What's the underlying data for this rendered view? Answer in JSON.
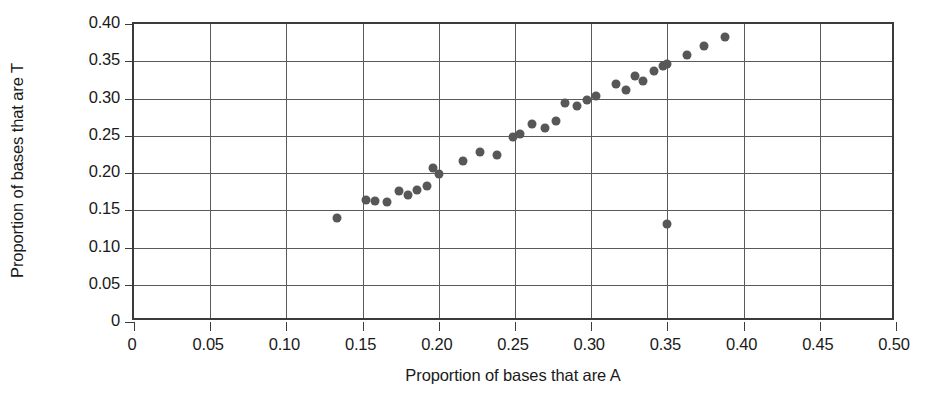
{
  "chart_data": {
    "type": "scatter",
    "title": "",
    "xlabel": "Proportion of bases that are A",
    "ylabel": "Proportion of bases that are T",
    "xlim": [
      0,
      0.5
    ],
    "ylim": [
      0,
      0.4
    ],
    "grid": true,
    "legend": null,
    "xticks": [
      0,
      0.05,
      0.1,
      0.15,
      0.2,
      0.25,
      0.3,
      0.35,
      0.4,
      0.45,
      0.5
    ],
    "yticks": [
      0,
      0.05,
      0.1,
      0.15,
      0.2,
      0.25,
      0.3,
      0.35,
      0.4
    ],
    "xtick_labels": [
      "0",
      "0.05",
      "0.10",
      "0.15",
      "0.20",
      "0.25",
      "0.30",
      "0.35",
      "0.40",
      "0.45",
      "0.50"
    ],
    "ytick_labels": [
      "0",
      "0.05",
      "0.10",
      "0.15",
      "0.20",
      "0.25",
      "0.30",
      "0.35",
      "0.40"
    ],
    "marker": {
      "shape": "circle",
      "color": "#575757",
      "size_px": 9
    },
    "points": [
      {
        "x": 0.133,
        "y": 0.139
      },
      {
        "x": 0.152,
        "y": 0.164
      },
      {
        "x": 0.158,
        "y": 0.162
      },
      {
        "x": 0.166,
        "y": 0.161
      },
      {
        "x": 0.174,
        "y": 0.176
      },
      {
        "x": 0.18,
        "y": 0.171
      },
      {
        "x": 0.186,
        "y": 0.177
      },
      {
        "x": 0.192,
        "y": 0.183
      },
      {
        "x": 0.196,
        "y": 0.207
      },
      {
        "x": 0.2,
        "y": 0.199
      },
      {
        "x": 0.216,
        "y": 0.216
      },
      {
        "x": 0.227,
        "y": 0.228
      },
      {
        "x": 0.238,
        "y": 0.224
      },
      {
        "x": 0.249,
        "y": 0.248
      },
      {
        "x": 0.253,
        "y": 0.253
      },
      {
        "x": 0.261,
        "y": 0.266
      },
      {
        "x": 0.27,
        "y": 0.261
      },
      {
        "x": 0.277,
        "y": 0.27
      },
      {
        "x": 0.283,
        "y": 0.294
      },
      {
        "x": 0.291,
        "y": 0.29
      },
      {
        "x": 0.297,
        "y": 0.298
      },
      {
        "x": 0.303,
        "y": 0.304
      },
      {
        "x": 0.316,
        "y": 0.32
      },
      {
        "x": 0.323,
        "y": 0.312
      },
      {
        "x": 0.329,
        "y": 0.33
      },
      {
        "x": 0.334,
        "y": 0.324
      },
      {
        "x": 0.341,
        "y": 0.337
      },
      {
        "x": 0.347,
        "y": 0.344
      },
      {
        "x": 0.35,
        "y": 0.346
      },
      {
        "x": 0.35,
        "y": 0.132
      },
      {
        "x": 0.363,
        "y": 0.358
      },
      {
        "x": 0.374,
        "y": 0.371
      },
      {
        "x": 0.388,
        "y": 0.383
      }
    ]
  }
}
